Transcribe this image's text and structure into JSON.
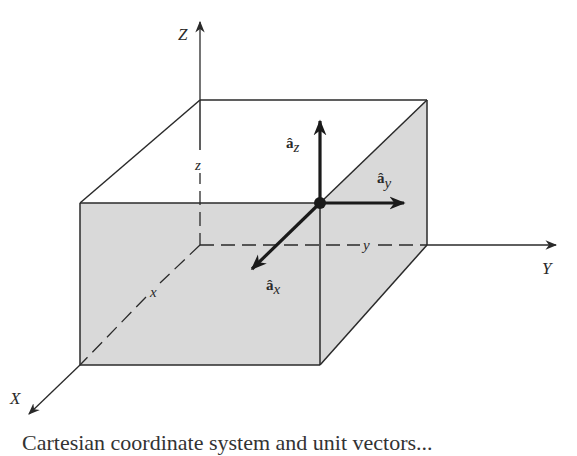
{
  "diagram": {
    "axes": {
      "x": {
        "label": "X",
        "coord_label": "x"
      },
      "y": {
        "label": "Y",
        "coord_label": "y"
      },
      "z": {
        "label": "Z",
        "coord_label": "z"
      }
    },
    "unit_vectors": {
      "ax": {
        "base": "â",
        "sub": "x"
      },
      "ay": {
        "base": "â",
        "sub": "y"
      },
      "az": {
        "base": "â",
        "sub": "z"
      }
    },
    "colors": {
      "line": "#2a2a2a",
      "shade": "#d9d9d9",
      "background": "#ffffff"
    },
    "caption_clipped": "Cartesian coordinate system and unit vectors..."
  }
}
